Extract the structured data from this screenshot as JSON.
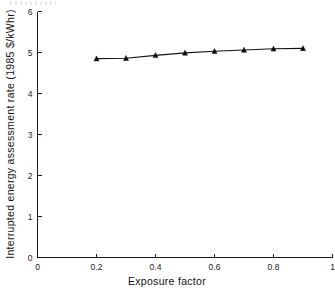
{
  "chart_data": {
    "type": "line",
    "title": "",
    "xlabel": "Exposure factor",
    "ylabel": "Interrupted energy assessment rate (1985 $/kWhr)",
    "xlim": [
      0,
      1
    ],
    "ylim": [
      0,
      6
    ],
    "xticks": [
      "0",
      "0.2",
      "0.4",
      "0.6",
      "0.8",
      "1"
    ],
    "xtick_values": [
      0,
      0.2,
      0.4,
      0.6,
      0.8,
      1
    ],
    "yticks": [
      "0",
      "1",
      "2",
      "3",
      "4",
      "5",
      "6"
    ],
    "ytick_values": [
      0,
      1,
      2,
      3,
      4,
      5,
      6
    ],
    "grid": false,
    "legend": "none",
    "marker": "triangle",
    "line_color": "#141414",
    "marker_color": "#0d0d0d",
    "series": [
      {
        "name": "Interrupted energy assessment rate",
        "x": [
          0.2,
          0.3,
          0.4,
          0.5,
          0.6,
          0.7,
          0.8,
          0.9
        ],
        "values": [
          4.85,
          4.86,
          4.93,
          4.99,
          5.03,
          5.06,
          5.09,
          5.1
        ]
      }
    ]
  },
  "axes": {
    "x_axis_label": "Exposure factor",
    "y_axis_label": "Interrupted energy assessment rate (1985 $/kWhr)"
  }
}
